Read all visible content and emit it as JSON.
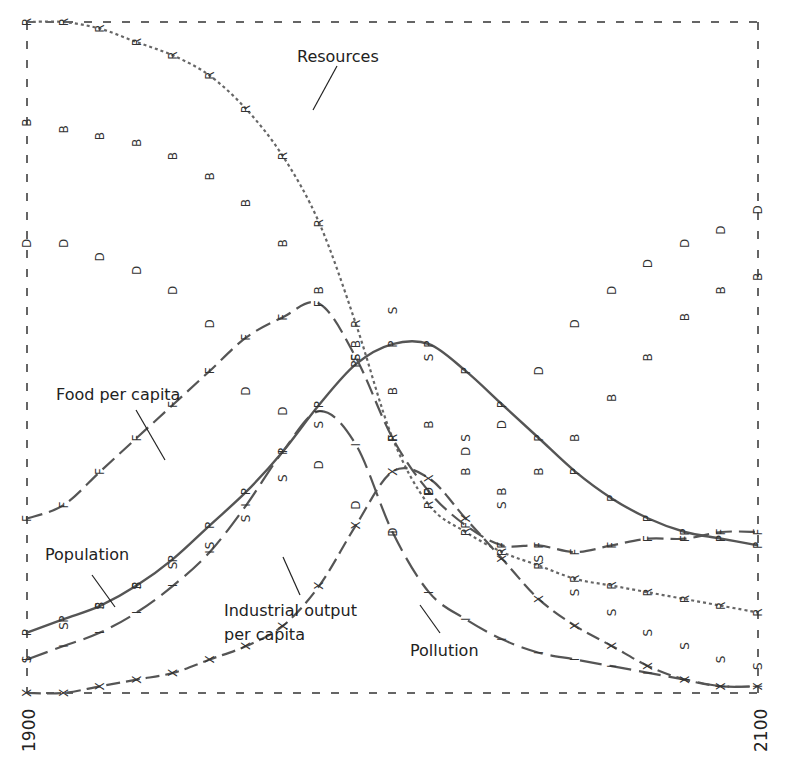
{
  "chart_data": {
    "type": "line",
    "title": "",
    "xlabel": "",
    "ylabel": "",
    "x_ticks": [
      "1900",
      "2100"
    ],
    "xlim": [
      1900,
      2100
    ],
    "grid": false,
    "frame": "dashed",
    "legend_position": "inline annotations",
    "x": [
      1900,
      1910,
      1920,
      1930,
      1940,
      1950,
      1960,
      1970,
      1980,
      1990,
      2000,
      2010,
      2020,
      2030,
      2040,
      2050,
      2060,
      2070,
      2080,
      2090,
      2100
    ],
    "series": [
      {
        "name": "Resources",
        "marker": "R",
        "style": "dotted",
        "values": [
          1.0,
          1.0,
          0.99,
          0.97,
          0.95,
          0.92,
          0.87,
          0.8,
          0.7,
          0.55,
          0.38,
          0.28,
          0.24,
          0.21,
          0.19,
          0.17,
          0.16,
          0.15,
          0.14,
          0.13,
          0.12
        ]
      },
      {
        "name": "Food per capita",
        "marker": "F",
        "style": "dashed",
        "values": [
          0.26,
          0.28,
          0.33,
          0.38,
          0.43,
          0.48,
          0.53,
          0.56,
          0.58,
          0.5,
          0.38,
          0.3,
          0.25,
          0.22,
          0.22,
          0.21,
          0.22,
          0.23,
          0.23,
          0.24,
          0.24
        ]
      },
      {
        "name": "Population",
        "marker": "P",
        "style": "solid",
        "values": [
          0.09,
          0.11,
          0.13,
          0.16,
          0.2,
          0.25,
          0.3,
          0.36,
          0.43,
          0.49,
          0.52,
          0.52,
          0.48,
          0.43,
          0.38,
          0.33,
          0.29,
          0.26,
          0.24,
          0.23,
          0.22
        ]
      },
      {
        "name": "Industrial output per capita",
        "marker": "I",
        "style": "long-dash",
        "values": [
          0.05,
          0.07,
          0.09,
          0.12,
          0.16,
          0.21,
          0.28,
          0.36,
          0.42,
          0.37,
          0.24,
          0.15,
          0.11,
          0.08,
          0.06,
          0.05,
          0.04,
          0.03,
          0.02,
          0.01,
          0.01
        ]
      },
      {
        "name": "Pollution",
        "marker": "X",
        "style": "dash-dot",
        "values": [
          0.0,
          0.0,
          0.01,
          0.02,
          0.03,
          0.05,
          0.07,
          0.1,
          0.16,
          0.25,
          0.33,
          0.32,
          0.26,
          0.2,
          0.14,
          0.1,
          0.07,
          0.04,
          0.02,
          0.01,
          0.01
        ]
      },
      {
        "name": "Birth rate",
        "marker": "B",
        "style": "markers-only",
        "values": [
          0.85,
          0.84,
          0.83,
          0.82,
          0.8,
          0.77,
          0.73,
          0.67,
          0.6,
          0.52,
          0.45,
          0.4,
          0.33,
          0.3,
          0.33,
          0.38,
          0.44,
          0.5,
          0.56,
          0.6,
          0.62
        ]
      },
      {
        "name": "Death rate",
        "marker": "D",
        "style": "markers-only",
        "values": [
          0.67,
          0.67,
          0.65,
          0.63,
          0.6,
          0.55,
          0.45,
          0.42,
          0.34,
          0.28,
          0.24,
          0.3,
          0.36,
          0.4,
          0.48,
          0.55,
          0.6,
          0.64,
          0.67,
          0.69,
          0.72
        ]
      },
      {
        "name": "Services per capita",
        "marker": "S",
        "style": "markers-only",
        "values": [
          0.05,
          0.1,
          0.13,
          0.16,
          0.19,
          0.22,
          0.26,
          0.32,
          0.4,
          0.5,
          0.57,
          0.5,
          0.38,
          0.28,
          0.2,
          0.15,
          0.12,
          0.09,
          0.07,
          0.05,
          0.04
        ]
      }
    ],
    "annotations": [
      {
        "text": "Resources",
        "series": "Resources"
      },
      {
        "text": "Food per capita",
        "series": "Food per capita"
      },
      {
        "text": "Population",
        "series": "Population"
      },
      {
        "text": "Industrial output\nper capita",
        "series": "Industrial output per capita"
      },
      {
        "text": "Pollution",
        "series": "Pollution"
      }
    ]
  },
  "labels": {
    "resources": "Resources",
    "food": "Food per capita",
    "population": "Population",
    "industrial_1": "Industrial output",
    "industrial_2": "per capita",
    "pollution": "Pollution"
  },
  "axis": {
    "x_start": "1900",
    "x_end": "2100"
  },
  "markers": {
    "R": "R",
    "F": "F",
    "P": "P",
    "I": "I",
    "X": "X",
    "B": "B",
    "D": "D",
    "S": "S"
  }
}
